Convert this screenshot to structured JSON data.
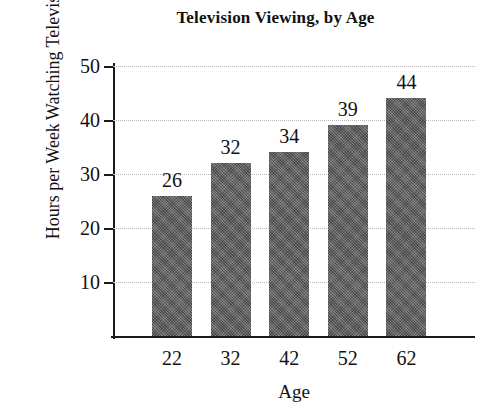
{
  "chart_data": {
    "type": "bar",
    "title": "Television Viewing, by Age",
    "xlabel": "Age",
    "ylabel": "Hours per Week Watching Television",
    "ylabel_lines": [
      "Hours per Week",
      "Watching Television"
    ],
    "categories": [
      "22",
      "32",
      "42",
      "52",
      "62"
    ],
    "values": [
      26,
      32,
      34,
      39,
      44
    ],
    "data_labels": [
      "26",
      "32",
      "34",
      "39",
      "44"
    ],
    "ylim": [
      0,
      50
    ],
    "yticks": [
      10,
      20,
      30,
      40,
      50
    ],
    "ytick_labels": [
      "10",
      "20",
      "30",
      "40",
      "50"
    ],
    "grid": "horizontal-dotted",
    "legend": "none",
    "series": [
      {
        "name": "Hours per Week Watching Television",
        "values": [
          26,
          32,
          34,
          39,
          44
        ],
        "color": "#6e6e6e"
      }
    ],
    "colors": {
      "bar_fill": "#6e6e6e",
      "axis": "#1a1a1a",
      "gridline": "#b9b9b9",
      "background": "#ffffff",
      "text": "#111111"
    }
  }
}
